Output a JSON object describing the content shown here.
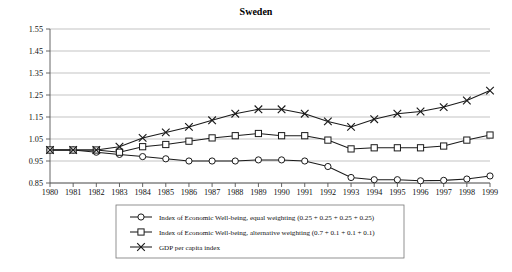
{
  "chart_data": {
    "type": "line",
    "title": "Sweden",
    "xlabel": "",
    "ylabel": "",
    "grid": true,
    "legend_position": "bottom",
    "xlim": [
      1980,
      1999
    ],
    "ylim": [
      0.85,
      1.55
    ],
    "ytick_step": 0.1,
    "yticks": [
      "1.55",
      "1.45",
      "1.35",
      "1.25",
      "1.15",
      "1.05",
      "0.95",
      "0.85"
    ],
    "categories": [
      "1980",
      "1981",
      "1982",
      "1983",
      "1984",
      "1985",
      "1986",
      "1987",
      "1988",
      "1989",
      "1990",
      "1991",
      "1992",
      "1993",
      "1994",
      "1995",
      "1996",
      "1997",
      "1998",
      "1999"
    ],
    "series": [
      {
        "name": "Index of Economic Well-being, equal weighting (0.25 + 0.25 + 0.25 + 0.25)",
        "marker": "circle",
        "values": [
          1.0,
          1.0,
          0.99,
          0.98,
          0.97,
          0.96,
          0.95,
          0.95,
          0.95,
          0.955,
          0.955,
          0.95,
          0.925,
          0.875,
          0.865,
          0.865,
          0.86,
          0.862,
          0.868,
          0.882
        ]
      },
      {
        "name": "Index of Economic Well-being, alternative weighting (0.7 + 0.1 + 0.1 + 0.1)",
        "marker": "square",
        "values": [
          1.0,
          1.0,
          1.0,
          0.99,
          1.015,
          1.025,
          1.04,
          1.055,
          1.065,
          1.075,
          1.065,
          1.065,
          1.045,
          1.005,
          1.01,
          1.01,
          1.01,
          1.018,
          1.045,
          1.068
        ]
      },
      {
        "name": "GDP per capita index",
        "marker": "x",
        "values": [
          1.0,
          1.0,
          1.0,
          1.015,
          1.055,
          1.08,
          1.105,
          1.135,
          1.165,
          1.185,
          1.185,
          1.165,
          1.13,
          1.105,
          1.14,
          1.165,
          1.175,
          1.195,
          1.225,
          1.27
        ]
      }
    ]
  },
  "legend": {
    "entries": [
      {
        "label": "Index of Economic Well-being, equal weighting (0.25 + 0.25 + 0.25 + 0.25)",
        "marker": "circle"
      },
      {
        "label": "Index of Economic Well-being, alternative weighting (0.7 + 0.1 + 0.1 + 0.1)",
        "marker": "square"
      },
      {
        "label": "GDP per capita index",
        "marker": "x"
      }
    ]
  },
  "colors": {
    "line": "#1a1a1a",
    "grid": "#9a9a9a",
    "axis": "#555555",
    "background": "#ffffff"
  }
}
